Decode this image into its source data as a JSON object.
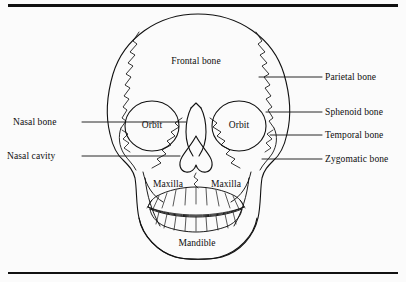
{
  "figure": {
    "title_visible": false,
    "background_color": "#fbfbfb",
    "ink_color": "#111111"
  },
  "frame": {
    "top_rule": "",
    "bottom_rule": ""
  },
  "diagram": {
    "style": "line-drawing"
  },
  "labels": {
    "right": [
      {
        "text": "Parietal bone",
        "x": 325,
        "y": 73,
        "leader_from_x": 259,
        "leader_from_y": 77,
        "leader_to_x": 322,
        "leader_to_y": 77
      },
      {
        "text": "Sphenoid bone",
        "x": 325,
        "y": 108,
        "leader_from_x": 266,
        "leader_from_y": 112,
        "leader_to_x": 322,
        "leader_to_y": 112
      },
      {
        "text": "Temporal bone",
        "x": 325,
        "y": 131,
        "leader_from_x": 270,
        "leader_from_y": 135,
        "leader_to_x": 322,
        "leader_to_y": 135
      },
      {
        "text": "Zygomatic bone",
        "x": 325,
        "y": 155,
        "leader_from_x": 262,
        "leader_from_y": 159,
        "leader_to_x": 322,
        "leader_to_y": 159
      }
    ],
    "left": [
      {
        "text": "Nasal bone",
        "x": 13,
        "y": 118,
        "leader_from_x": 82,
        "leader_from_y": 122,
        "leader_to_x": 186,
        "leader_to_y": 122
      },
      {
        "text": "Nasal cavity",
        "x": 7,
        "y": 152,
        "leader_from_x": 82,
        "leader_from_y": 156,
        "leader_to_x": 180,
        "leader_to_y": 156
      }
    ],
    "interior": [
      {
        "text": "Frontal bone",
        "x": 196,
        "y": 57,
        "align": "center"
      },
      {
        "text": "Orbit",
        "x": 152,
        "y": 126,
        "align": "center"
      },
      {
        "text": "Orbit",
        "x": 239,
        "y": 126,
        "align": "center"
      },
      {
        "text": "Maxilla",
        "x": 168,
        "y": 180,
        "align": "center"
      },
      {
        "text": "Maxilla",
        "x": 226,
        "y": 180,
        "align": "center"
      },
      {
        "text": "Mandible",
        "x": 197,
        "y": 239,
        "align": "center"
      }
    ]
  },
  "bone_regions": [
    "frontal bone",
    "parietal bone",
    "sphenoid bone",
    "temporal bone",
    "zygomatic bone",
    "nasal bone",
    "nasal cavity",
    "orbit",
    "maxilla",
    "mandible"
  ]
}
